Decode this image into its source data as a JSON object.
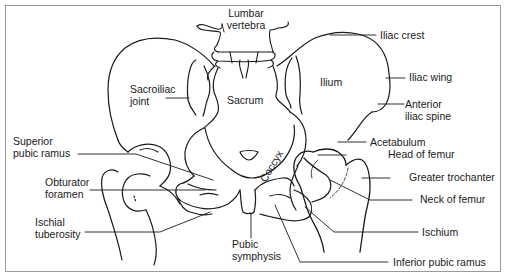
{
  "diagram": {
    "line_color": "#1a1a1a",
    "frame_color": "#9a9a9a",
    "labels": {
      "lumbar_vertebra": "Lumbar\nvertebra",
      "iliac_crest": "Iliac crest",
      "iliac_wing": "Iliac wing",
      "anterior_iliac_spine": "Anterior\niliac spine",
      "acetabulum": "Acetabulum",
      "head_of_femur": "Head of femur",
      "greater_trochanter": "Greater trochanter",
      "neck_of_femur": "Neck of femur",
      "ischium": "Ischium",
      "inferior_pubic_ramus": "Inferior pubic ramus",
      "pubic_symphysis": "Pubic\nsymphysis",
      "ischial_tuberosity": "Ischial\ntuberosity",
      "obturator_foramen": "Obturator\nforamen",
      "superior_pubic_ramus": "Superior\npubic ramus",
      "sacroiliac_joint": "Sacroiliac\njoint",
      "sacrum": "Sacrum",
      "ilium": "Ilium",
      "coccyx": "Coccyx"
    }
  }
}
